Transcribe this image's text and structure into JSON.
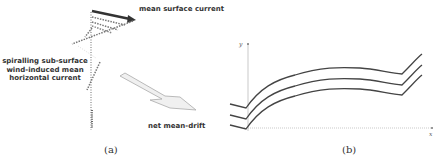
{
  "panel_a": {
    "labels": {
      "surface_current": "mean surface current",
      "subsurface_line1": "spiralling sub-surface",
      "subsurface_line2": "wind-induced mean",
      "subsurface_line3": "horizontal current",
      "net_drift": "net mean-drift"
    },
    "caption": "(a)"
  },
  "panel_b": {
    "axes": {
      "y_label": "y",
      "x_label": "x"
    },
    "caption": "(b)"
  },
  "colors": {
    "dark_arrow": "#333333",
    "dotted": "#777777",
    "drift_fill": "#eeeeee",
    "curve": "#444444",
    "axis": "#bbbbbb"
  }
}
